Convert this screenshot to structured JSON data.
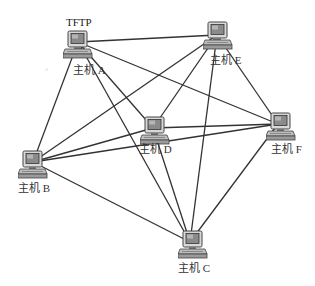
{
  "diagram": {
    "type": "network-topology",
    "topology": "full-mesh",
    "edge_color": "#333333",
    "nodes": [
      {
        "id": "A",
        "label": "主机 A",
        "extra_label": "TFTP",
        "x": 78,
        "y": 42
      },
      {
        "id": "E",
        "label": "主机 E",
        "x": 217,
        "y": 35
      },
      {
        "id": "D",
        "label": "主机 D",
        "x": 153,
        "y": 128
      },
      {
        "id": "F",
        "label": "主机 F",
        "x": 278,
        "y": 124
      },
      {
        "id": "B",
        "label": "主机 B",
        "x": 33,
        "y": 162
      },
      {
        "id": "C",
        "label": "主机 C",
        "x": 190,
        "y": 242
      }
    ],
    "edges": [
      [
        "A",
        "E"
      ],
      [
        "A",
        "B"
      ],
      [
        "A",
        "C"
      ],
      [
        "A",
        "D"
      ],
      [
        "A",
        "F"
      ],
      [
        "E",
        "B"
      ],
      [
        "E",
        "D"
      ],
      [
        "E",
        "C"
      ],
      [
        "E",
        "F"
      ],
      [
        "D",
        "B"
      ],
      [
        "D",
        "C"
      ],
      [
        "D",
        "F"
      ],
      [
        "F",
        "B"
      ],
      [
        "F",
        "C"
      ],
      [
        "B",
        "C"
      ]
    ]
  }
}
